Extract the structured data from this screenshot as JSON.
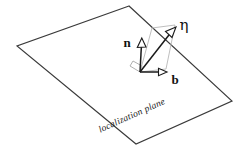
{
  "figure": {
    "name": "localization-plane-frame-diagram",
    "background_color": "#ffffff",
    "plane": {
      "caption": "localization plane",
      "edge_color": "#3a3a3a",
      "corners_label": [
        "top",
        "left",
        "bottom",
        "right"
      ]
    },
    "auxiliary_quad": {
      "name": "normal-plane-quad",
      "color": "#bfbfbf"
    },
    "angle_marker": {
      "name": "right-angle-marker",
      "color": "#b0b0b0"
    },
    "vectors": [
      {
        "id": "n",
        "label": "n",
        "label_style": "bold",
        "description": "normal vector"
      },
      {
        "id": "eta",
        "label": "η",
        "label_style": "greek",
        "description": "eta vector"
      },
      {
        "id": "b",
        "label": "b",
        "label_style": "bold",
        "description": "binormal vector"
      }
    ],
    "vector_color": "#1a1a1a",
    "arrowhead_fill": "#ffffff"
  }
}
